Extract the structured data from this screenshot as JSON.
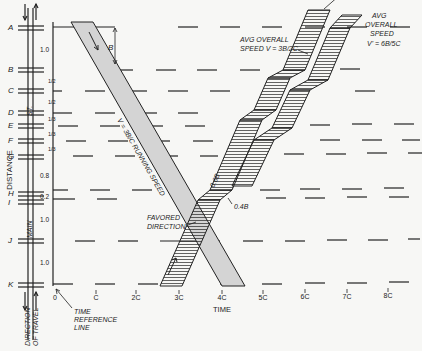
{
  "diagram": {
    "type": "time-space diagram (progressive signal system)",
    "stations": [
      {
        "id": "A",
        "y": 27
      },
      {
        "id": "B",
        "y": 69
      },
      {
        "id": "C",
        "y": 90
      },
      {
        "id": "D",
        "y": 112
      },
      {
        "id": "E",
        "y": 125
      },
      {
        "id": "F",
        "y": 140
      },
      {
        "id": "G",
        "y": 156
      },
      {
        "id": "H",
        "y": 193
      },
      {
        "id": "I",
        "y": 201
      },
      {
        "id": "J",
        "y": 240
      },
      {
        "id": "K",
        "y": 284
      }
    ],
    "segment_labels": [
      {
        "text": "1.0",
        "y": 50
      },
      {
        "text": "1/2",
        "y": 80
      },
      {
        "text": "1/2",
        "y": 101
      },
      {
        "text": "1/3",
        "y": 118
      },
      {
        "text": "1/3",
        "y": 133
      },
      {
        "text": "1/3",
        "y": 148
      },
      {
        "text": "0.8",
        "y": 176
      },
      {
        "text": "0.2",
        "y": 196
      },
      {
        "text": "1.0",
        "y": 220
      },
      {
        "text": "1.0",
        "y": 263
      }
    ],
    "street_label": "ST.",
    "main_label": "MAIN",
    "distance_label": "DISTANCE",
    "direction_label_1": "DIRECTION",
    "direction_label_2": "OF TRAVEL",
    "time_axis": {
      "label": "TIME",
      "ticks": [
        {
          "text": "0",
          "x": 56
        },
        {
          "text": "C",
          "x": 96
        },
        {
          "text": "2C",
          "x": 136
        },
        {
          "text": "3C",
          "x": 179
        },
        {
          "text": "4C",
          "x": 222
        },
        {
          "text": "5C",
          "x": 263
        },
        {
          "text": "6C",
          "x": 305
        },
        {
          "text": "7C",
          "x": 347
        },
        {
          "text": "8C",
          "x": 388
        }
      ]
    },
    "time_reference_label_1": "TIME",
    "time_reference_label_2": "REFERENCE",
    "time_reference_label_3": "LINE",
    "band_B_label": "B",
    "running_speed_label": "V = 3B/C  RUNNING SPEED",
    "favored_label_1": "FAVORED",
    "favored_label_2": "DIRECTION",
    "label_06B": "0.6B",
    "label_04B": "0.4B",
    "avg_speed_1_line1": "AVG OVERALL",
    "avg_speed_1_line2": "SPEED V = 3B/2C",
    "avg_speed_2_line1": "AVG",
    "avg_speed_2_line2": "OVERALL",
    "avg_speed_2_line3": "SPEED",
    "avg_speed_2_line4": "V' = 6B/5C",
    "colors": {
      "ink": "#222222",
      "band_fill": "#d4d4d4",
      "background": "#f7f7f5"
    }
  }
}
